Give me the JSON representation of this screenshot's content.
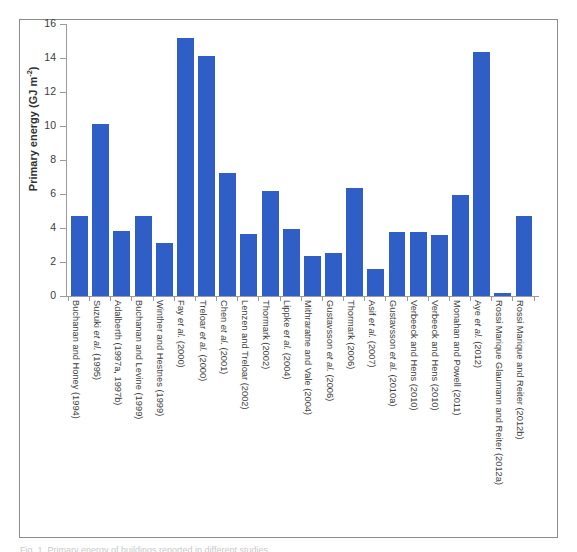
{
  "figure": {
    "caption_partial": "Fig. 1. Primary energy of buildings reported in different studies."
  },
  "chart_data": {
    "type": "bar",
    "title": "",
    "xlabel": "",
    "ylabel": "Primary energy (GJ m-2)",
    "ylabel_base": "Primary energy (GJ m",
    "ylabel_sup": "-2",
    "ylabel_tail": ")",
    "ylim": [
      0,
      16
    ],
    "yticks": [
      0,
      2,
      4,
      6,
      8,
      10,
      12,
      14,
      16
    ],
    "ytick_labels": [
      "0",
      "2",
      "4",
      "6",
      "8",
      "10",
      "12",
      "14",
      "16"
    ],
    "grid": false,
    "legend": "none",
    "bar_color": "#2f5fc6",
    "categories": [
      "Buchanan and Honey (1994)",
      "Suzuki et al. (1995)",
      "Adalberth (1997a, 1997b)",
      "Buchanan and Levine (1999)",
      "Winther and Hestnes (1999)",
      "Fay et al. (2000)",
      "Treloar et al. (2000)",
      "Chen et al. (2001)",
      "Lenzen and Treloar (2002)",
      "Thormark (2002)",
      "Lippke et al. (2004)",
      "Mithraratne and Vale (2004)",
      "Gustavsson et al. (2006)",
      "Thormark (2006)",
      "Asif et al. (2007)",
      "Gustavsson et al. (2010a)",
      "Verbeeck and Hens (2010)",
      "Verbeeck and Hens (2010)",
      "Monahan and Powell (2011)",
      "Aye et al. (2012)",
      "Rossi Marique Glaumann and Reiter (2012a)",
      "Rossi Marique and Reiter (2012b)"
    ],
    "categories_italic_part": [
      "",
      "et al.",
      "",
      "",
      "",
      "et al.",
      "et al.",
      "et al.",
      "",
      "",
      "et al.",
      "",
      "et al.",
      "",
      "et al.",
      "et al.",
      "",
      "",
      "",
      "et al.",
      "",
      ""
    ],
    "values": [
      4.7,
      10.1,
      3.8,
      4.7,
      3.1,
      15.2,
      14.1,
      7.25,
      3.65,
      6.15,
      3.95,
      2.35,
      2.55,
      6.35,
      1.6,
      3.75,
      3.75,
      3.6,
      5.95,
      14.35,
      0.15,
      4.7
    ]
  }
}
